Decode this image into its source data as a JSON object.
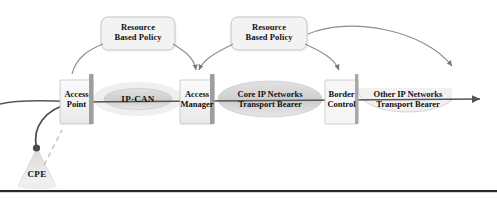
{
  "figure": {
    "background_color": "#ffffff",
    "bottom_rule_color": "#2b2b2b"
  },
  "policies": [
    {
      "id": "policy-left",
      "line1": "Resource",
      "line2": "Based Policy",
      "shape": "rounded-rectangle",
      "fill": "#f2f2f2",
      "stroke": "#b3b3b3"
    },
    {
      "id": "policy-right",
      "line1": "Resource",
      "line2": "Based Policy",
      "shape": "rounded-rectangle",
      "fill": "#f2f2f2",
      "stroke": "#b3b3b3"
    }
  ],
  "gates": [
    {
      "id": "access-point",
      "line1": "Access",
      "line2": "Point",
      "fill": "#f0f0f0",
      "stroke": "#9a9a9a"
    },
    {
      "id": "access-manager",
      "line1": "Access",
      "line2": "Manager",
      "fill": "#f0f0f0",
      "stroke": "#9a9a9a"
    },
    {
      "id": "border-control",
      "line1": "Border",
      "line2": "Control",
      "fill": "#f4f4f4",
      "stroke": "#9a9a9a"
    }
  ],
  "networks": [
    {
      "id": "ip-can",
      "label": "IP-CAN",
      "shape": "ellipse",
      "fill": "#dcdcdc"
    },
    {
      "id": "core-ip-networks",
      "line1": "Core IP Networks",
      "line2": "Transport Bearer",
      "shape": "ellipse",
      "fill": "#cfcfcf"
    },
    {
      "id": "other-ip-networks",
      "line1": "Other IP Networks",
      "line2": "Transport Bearer",
      "shape": "arc",
      "fill": "#efefef"
    }
  ],
  "endpoint": {
    "id": "cpe",
    "label": "CPE",
    "shape": "cone",
    "fill": "#e6e6e6"
  },
  "connectors": {
    "bearer_arrow_color": "#555555",
    "policy_arrow_color": "#777777",
    "cpe_link_color": "#4a4a4a"
  }
}
